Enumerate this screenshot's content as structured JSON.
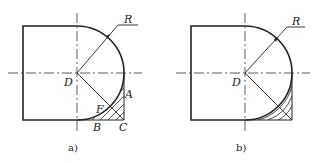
{
  "figures": [
    {
      "id": "a",
      "caption": "a)",
      "labels": {
        "R": "R",
        "D": "D",
        "F": "F",
        "A": "A",
        "B": "B",
        "C": "C"
      }
    },
    {
      "id": "b",
      "caption": "b)",
      "labels": {
        "R": "R",
        "D": "D"
      }
    }
  ],
  "colors": {
    "line": "#222222",
    "background": "#ffffff"
  }
}
